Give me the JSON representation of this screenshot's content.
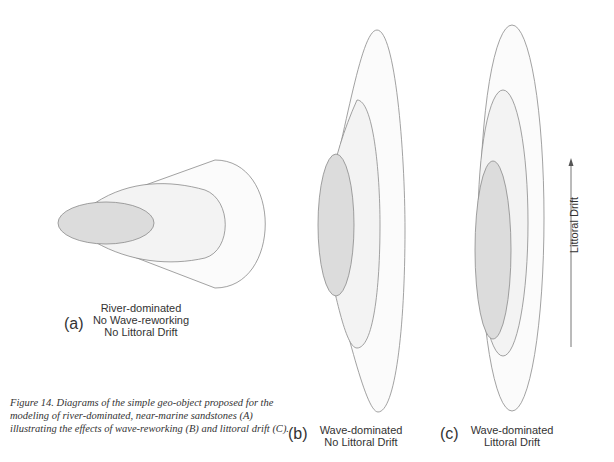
{
  "figure": {
    "caption": "Figure 14. Diagrams of the simple geo-object proposed for the modeling of river-dominated, near-marine sandstones (A) illustrating the effects of wave-reworking (B) and littoral drift (C).",
    "panels": [
      {
        "letter": "(a)",
        "lines": [
          "River-dominated",
          "No Wave-reworking",
          "No Littoral Drift"
        ]
      },
      {
        "letter": "(b)",
        "lines": [
          "Wave-dominated",
          "No Littoral Drift"
        ]
      },
      {
        "letter": "(c)",
        "lines": [
          "Wave-dominated",
          "Littoral Drift"
        ]
      }
    ],
    "arrow_label": "Littoral Drift",
    "colors": {
      "outline": "#8a8a8a",
      "inner_fill": "#dcdcdc",
      "middle_fill": "#f3f3f3",
      "outer_fill": "#fbfbfb",
      "text": "#333333"
    }
  }
}
